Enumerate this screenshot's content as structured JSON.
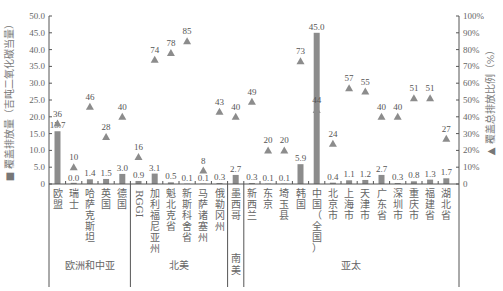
{
  "chart_data": {
    "type": "bar",
    "title": "",
    "categories": [
      "欧盟",
      "瑞士",
      "哈萨克斯坦",
      "英国",
      "德国",
      "RGGI",
      "加利福尼亚州",
      "魁北克省",
      "新斯科舍省",
      "马萨诸塞州",
      "俄勒冈州",
      "墨西哥",
      "新西兰",
      "东京",
      "埼玉县",
      "韩国",
      "中国（全国）",
      "北京市",
      "上海市",
      "天津市",
      "广东省",
      "深圳市",
      "重庆市",
      "福建省",
      "湖北省"
    ],
    "groups": [
      {
        "name": "欧洲和中亚",
        "start": 0,
        "end": 4
      },
      {
        "name": "北美",
        "start": 5,
        "end": 10
      },
      {
        "name": "南美",
        "start": 11,
        "end": 11
      },
      {
        "name": "亚太",
        "start": 12,
        "end": 24
      }
    ],
    "series": [
      {
        "name": "覆盖排放量（吉吨二氧化碳当量）",
        "type": "bar",
        "axis": "left",
        "color": "#8c8c8c",
        "values": [
          15.7,
          0.0,
          1.4,
          1.5,
          3.0,
          0.9,
          3.1,
          0.5,
          0.1,
          0.1,
          0.3,
          2.7,
          0.3,
          0.1,
          0.1,
          5.9,
          45.0,
          0.4,
          1.1,
          1.2,
          2.7,
          0.3,
          0.8,
          1.3,
          1.7
        ],
        "labels": [
          "15.7",
          "0.0",
          "1.4",
          "1.5",
          "3.0",
          "0.9",
          "3.1",
          "0.5",
          "0.1",
          "0.1",
          "0.3",
          "2.7",
          "0.3",
          "0.1",
          "0.1",
          "5.9",
          "45.0",
          "0.4",
          "1.1",
          "1.2",
          "2.7",
          "0.3",
          "0.8",
          "1.3",
          "1.7"
        ]
      },
      {
        "name": "覆盖总排放比例（%）",
        "type": "scatter",
        "marker": "triangle",
        "axis": "right",
        "color": "#8c8c8c",
        "values": [
          36,
          10,
          46,
          28,
          40,
          16,
          74,
          78,
          85,
          8,
          43,
          40,
          49,
          20,
          20,
          73,
          44,
          24,
          57,
          55,
          40,
          40,
          51,
          51,
          27
        ]
      }
    ],
    "ylabel": "覆盖排放量（吉吨二氧化碳当量）",
    "y2label": "覆盖总排放比例（%）",
    "ylim": [
      0,
      50
    ],
    "y2lim": [
      0,
      100
    ],
    "yticks": [
      "0",
      "5.0",
      "10.0",
      "15.0",
      "20.0",
      "25.0",
      "30.0",
      "35.0",
      "40.0",
      "45.0",
      "50.0"
    ],
    "y2ticks": [
      "0",
      "10%",
      "20%",
      "30%",
      "40%",
      "50%",
      "60%",
      "70%",
      "80%",
      "90%",
      "100%"
    ],
    "grid": false,
    "legend": "axis-labels"
  }
}
